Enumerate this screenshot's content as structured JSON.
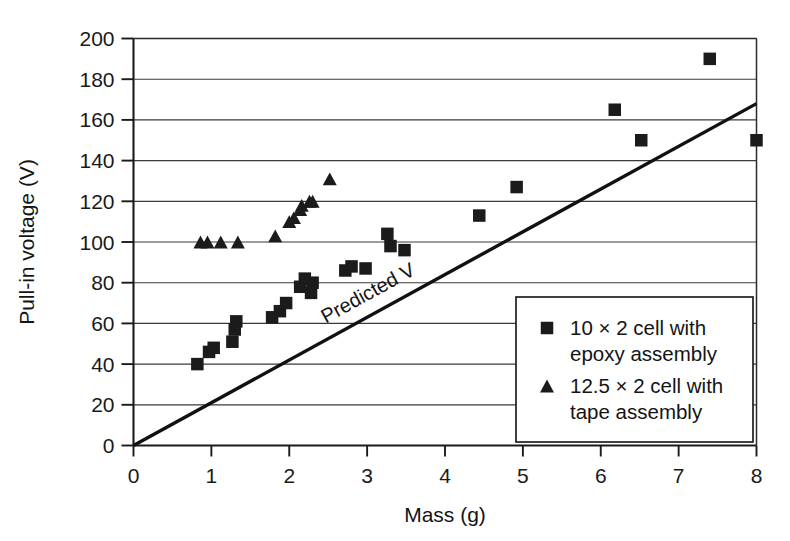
{
  "chart_data": {
    "type": "scatter",
    "title": "",
    "xlabel": "Mass (g)",
    "ylabel": "Pull-in voltage (V)",
    "xlim": [
      0,
      8
    ],
    "ylim": [
      0,
      200
    ],
    "xticks": [
      0,
      1,
      2,
      3,
      4,
      5,
      6,
      7,
      8
    ],
    "yticks": [
      0,
      20,
      40,
      60,
      80,
      100,
      120,
      140,
      160,
      180,
      200
    ],
    "xtick_labels": [
      "0",
      "1",
      "2",
      "3",
      "4",
      "5",
      "6",
      "7",
      "8"
    ],
    "ytick_labels": [
      "0",
      "20",
      "40",
      "60",
      "80",
      "100",
      "120",
      "140",
      "160",
      "180",
      "200"
    ],
    "grid": "horizontal",
    "legend_position": "lower-right-inside",
    "marker_color": "#1b1b1b",
    "line_color": "#111111",
    "series": [
      {
        "name": "10 × 2 cell with epoxy assembly",
        "marker": "square",
        "points": [
          [
            0.82,
            40
          ],
          [
            0.97,
            46
          ],
          [
            1.03,
            48
          ],
          [
            1.27,
            51
          ],
          [
            1.3,
            57
          ],
          [
            1.32,
            61
          ],
          [
            1.78,
            63
          ],
          [
            1.88,
            66
          ],
          [
            1.96,
            70
          ],
          [
            2.14,
            78
          ],
          [
            2.2,
            82
          ],
          [
            2.28,
            75
          ],
          [
            2.3,
            80
          ],
          [
            2.72,
            86
          ],
          [
            2.8,
            88
          ],
          [
            2.98,
            87
          ],
          [
            3.26,
            104
          ],
          [
            3.3,
            98
          ],
          [
            3.48,
            96
          ],
          [
            4.44,
            113
          ],
          [
            4.92,
            127
          ],
          [
            6.18,
            165
          ],
          [
            6.52,
            150
          ],
          [
            7.4,
            190
          ],
          [
            8.0,
            150
          ]
        ]
      },
      {
        "name": "12.5 × 2 cell with tape assembly",
        "marker": "triangle",
        "points": [
          [
            0.86,
            100
          ],
          [
            0.95,
            100
          ],
          [
            1.12,
            100
          ],
          [
            1.34,
            100
          ],
          [
            1.82,
            103
          ],
          [
            2.0,
            110
          ],
          [
            2.06,
            112
          ],
          [
            2.14,
            116
          ],
          [
            2.16,
            118
          ],
          [
            2.26,
            120
          ],
          [
            2.3,
            120
          ],
          [
            2.52,
            131
          ]
        ]
      }
    ],
    "trend_line": {
      "label": "Predicted V",
      "from": [
        0,
        0
      ],
      "to": [
        8,
        168
      ],
      "label_at": [
        3.05,
        72
      ]
    }
  },
  "legend": {
    "entries": [
      {
        "marker": "square",
        "line1": "10 × 2 cell with",
        "line2": "epoxy assembly"
      },
      {
        "marker": "triangle",
        "line1": "12.5 × 2 cell with",
        "line2": "tape assembly"
      }
    ]
  }
}
